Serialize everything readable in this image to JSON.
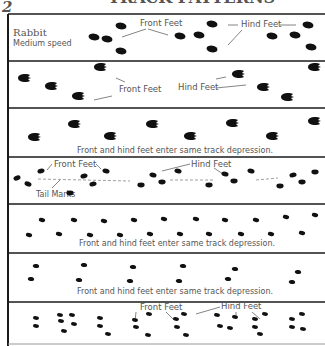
{
  "header": {
    "page_glyph": "2",
    "title_cropped": "TRACK PATTERNS"
  },
  "panels": [
    {
      "id": "rabbit-medium",
      "title": "Rabbit",
      "subtitle": "Medium speed",
      "labels": [
        {
          "text": "Front Feet",
          "role": "front-feet-label"
        },
        {
          "text": "Hind Feet",
          "role": "hind-feet-label"
        }
      ],
      "track_shape": "oval"
    },
    {
      "id": "panel-2",
      "labels": [
        {
          "text": "Front Feet",
          "role": "front-feet-label"
        },
        {
          "text": "Hind Feet",
          "role": "hind-feet-label"
        }
      ],
      "track_shape": "claw"
    },
    {
      "id": "panel-3",
      "caption": "Front and hind feet enter same track depression.",
      "track_shape": "claw"
    },
    {
      "id": "panel-4",
      "labels": [
        {
          "text": "Front Feet",
          "role": "front-feet-label"
        },
        {
          "text": "Hind Feet",
          "role": "hind-feet-label"
        },
        {
          "text": "Tail Marks",
          "role": "tail-marks-label"
        }
      ],
      "track_shape": "oval"
    },
    {
      "id": "panel-5",
      "caption": "Front and hind feet enter same track depression.",
      "track_shape": "small"
    },
    {
      "id": "panel-6",
      "caption": "Front and hind feet enter same track depression.",
      "track_shape": "small"
    },
    {
      "id": "panel-7",
      "labels": [
        {
          "text": "Front Feet",
          "role": "front-feet-label"
        },
        {
          "text": "Hind Feet",
          "role": "hind-feet-label"
        }
      ],
      "track_shape": "small"
    }
  ],
  "colors": {
    "ink": "#111111",
    "label": "#555555",
    "border": "#1a1a1a",
    "background": "#ffffff"
  }
}
